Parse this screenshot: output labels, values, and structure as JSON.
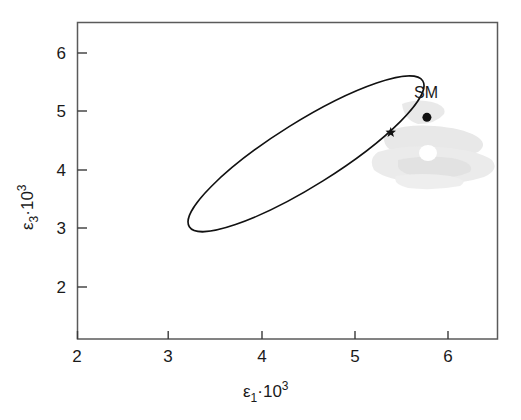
{
  "chart_data": {
    "type": "scatter",
    "title": "",
    "xlabel": "ε₁·10³",
    "ylabel": "ε₃·10³",
    "xlabel_parts": {
      "base": "ε",
      "sub": "1",
      "rest": "·10",
      "sup": "3"
    },
    "ylabel_parts": {
      "base": "ε",
      "sub": "3",
      "rest": "·10",
      "sup": "3"
    },
    "xlim": [
      1.78,
      6.54
    ],
    "ylim": [
      0.89,
      6.53
    ],
    "xticks": [
      2,
      3,
      4,
      5,
      6
    ],
    "yticks": [
      2,
      3,
      4,
      5,
      6
    ],
    "xticklabels": [
      "2",
      "3",
      "4",
      "5",
      "6"
    ],
    "yticklabels": [
      "2",
      "3",
      "4",
      "5",
      "6"
    ],
    "grid": false,
    "legend": "none",
    "frame": "box",
    "tick_direction": "in",
    "annotations": [
      {
        "name": "sm-label",
        "text": "SM",
        "x": 5.73,
        "y": 5.18
      }
    ],
    "series": [
      {
        "name": "confidence-ellipse",
        "type": "ellipse",
        "center_x": 4.37,
        "center_y": 4.19,
        "semi_major": 1.56,
        "semi_minor": 0.57,
        "angle_deg": 32.0,
        "stroke": "#111111",
        "stroke_width": 1.6,
        "fill": "none"
      },
      {
        "name": "best-fit-point",
        "type": "marker",
        "marker": "star",
        "x": 5.33,
        "y": 4.57,
        "color": "#111111",
        "size": 11
      },
      {
        "name": "standard-model-point",
        "type": "marker",
        "marker": "circle",
        "x": 5.74,
        "y": 4.84,
        "color": "#111111",
        "size": 9
      }
    ],
    "artifacts": [
      {
        "name": "scan-smudge",
        "color": "#e2e2e2",
        "note": "light gray scan smudge right of ellipse"
      }
    ]
  },
  "figure": {
    "background": "#ffffff",
    "axis_color": "#555555",
    "ink_color": "#111111"
  }
}
